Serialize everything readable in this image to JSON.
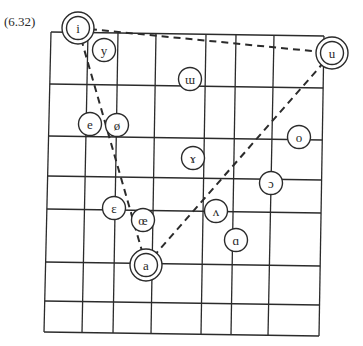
{
  "figure": {
    "number_label": "(6.32)",
    "colors": {
      "line": "#2b2b2b",
      "background": "#ffffff",
      "text": "#2a2a2a"
    }
  },
  "grid": {
    "corners": {
      "top_left": [
        51,
        32
      ],
      "top_right": [
        324,
        36
      ],
      "bottom_left": [
        44,
        332
      ],
      "bottom_right": [
        319,
        336
      ]
    },
    "vertical_lines_top_x": [
      51,
      88,
      118,
      156,
      206,
      236,
      274,
      324
    ],
    "vertical_lines_bottom_x": [
      44,
      82,
      113,
      151,
      201,
      231,
      268,
      319
    ],
    "horizontal_lines_left_y": [
      32,
      84,
      136,
      176,
      209,
      262,
      301,
      332
    ],
    "horizontal_lines_right_y": [
      36,
      88,
      140,
      180,
      213,
      266,
      305,
      336
    ]
  },
  "vowels": [
    {
      "symbol": "i",
      "x": 78,
      "y": 28,
      "cardinal": true
    },
    {
      "symbol": "y",
      "x": 104,
      "y": 50,
      "cardinal": false
    },
    {
      "symbol": "ɯ",
      "x": 190,
      "y": 79,
      "cardinal": false
    },
    {
      "symbol": "u",
      "x": 332,
      "y": 53,
      "cardinal": true
    },
    {
      "symbol": "e",
      "x": 90,
      "y": 124,
      "cardinal": false
    },
    {
      "symbol": "ø",
      "x": 117,
      "y": 125,
      "cardinal": false
    },
    {
      "symbol": "o",
      "x": 299,
      "y": 137,
      "cardinal": false
    },
    {
      "symbol": "ɤ",
      "x": 193,
      "y": 158,
      "cardinal": false
    },
    {
      "symbol": "ɔ",
      "x": 271,
      "y": 183,
      "cardinal": false
    },
    {
      "symbol": "ɛ",
      "x": 114,
      "y": 208,
      "cardinal": false
    },
    {
      "symbol": "œ",
      "x": 143,
      "y": 220,
      "cardinal": false
    },
    {
      "symbol": "ʌ",
      "x": 216,
      "y": 211,
      "cardinal": false
    },
    {
      "symbol": "ɑ",
      "x": 236,
      "y": 240,
      "cardinal": false
    },
    {
      "symbol": "a",
      "x": 146,
      "y": 265,
      "cardinal": true
    }
  ],
  "dashed_triangle": {
    "vertices": [
      "i",
      "u",
      "a"
    ],
    "points": [
      [
        78,
        28
      ],
      [
        332,
        53
      ],
      [
        146,
        265
      ]
    ]
  }
}
